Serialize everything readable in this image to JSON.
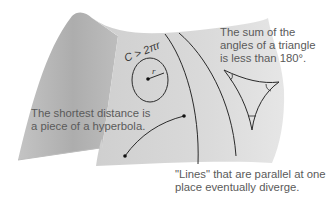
{
  "diagram": {
    "colors": {
      "surface_light": "#d6d6d6",
      "surface_dark": "#a9a9a9",
      "line": "#2a2a2a",
      "text": "#5a5a5a"
    },
    "circle_label": "C > 2πr",
    "radius_label": "r",
    "annotations": {
      "triangle": [
        "The sum of the",
        "angles of a triangle",
        "is less than 180°."
      ],
      "shortest": [
        "The shortest distance is",
        "a piece of a hyperbola."
      ],
      "parallel": [
        "\"Lines\" that are parallel at one",
        "place eventually diverge."
      ]
    }
  }
}
